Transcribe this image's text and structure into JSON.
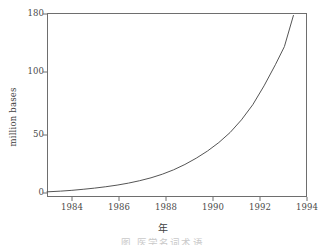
{
  "figure": {
    "background_color": "#ffffff",
    "frame_color": "#6e6e6e",
    "curve_color": "#555555"
  },
  "chart_data": {
    "type": "line",
    "title": "",
    "subtitle": "",
    "xlabel": "年",
    "ylabel": "million bases",
    "grid": false,
    "legend": null,
    "xlim": [
      1982.9,
      1994.4
    ],
    "ylim": [
      0,
      185
    ],
    "xticks": [
      1984,
      1986,
      1988,
      1990,
      1992,
      1994
    ],
    "xtick_labels": [
      "1984",
      "1986",
      "1988",
      "1990",
      "1992",
      "1994"
    ],
    "yticks": [
      0,
      50,
      100,
      180
    ],
    "ytick_labels": [
      "0",
      "50",
      "100",
      "180"
    ],
    "ytick_pixel_y": [
      193,
      135,
      72,
      14
    ],
    "series": [
      {
        "name": "GenBank growth",
        "x": [
          1982.9,
          1983.5,
          1984.0,
          1984.5,
          1985.0,
          1985.5,
          1986.0,
          1986.5,
          1987.0,
          1987.5,
          1988.0,
          1988.5,
          1989.0,
          1989.5,
          1990.0,
          1990.5,
          1991.0,
          1991.5,
          1992.0,
          1992.5,
          1993.0,
          1993.4,
          1993.8
        ],
        "y": [
          1.0,
          1.6,
          2.3,
          3.2,
          4.2,
          5.4,
          6.8,
          8.5,
          10.6,
          13.1,
          16.2,
          20.0,
          24.6,
          30.0,
          36.2,
          43.5,
          52.0,
          62.0,
          74.0,
          89.0,
          110.0,
          135.0,
          178.0
        ]
      }
    ],
    "annotations": []
  },
  "caption": {
    "text": "图           医学名词术语",
    "visible_fraction": "top-clipped"
  }
}
